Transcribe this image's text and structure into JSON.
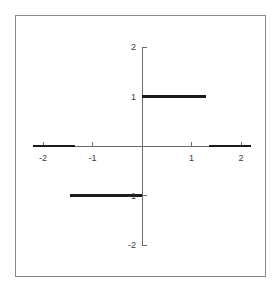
{
  "figure": {
    "frame": {
      "border_color": "#8a8a8a"
    },
    "axis_color": "#6b6b6b",
    "series_color": "#1a1a1a",
    "background": "#ffffff"
  },
  "labels": {
    "x": [
      {
        "value": -2,
        "text": "-2"
      },
      {
        "value": -1,
        "text": "-1"
      },
      {
        "value": 1,
        "text": "1"
      },
      {
        "value": 2,
        "text": "2"
      }
    ],
    "y": [
      {
        "value": 2,
        "text": "2"
      },
      {
        "value": 1,
        "text": "1"
      },
      {
        "value": -1,
        "text": "-1"
      },
      {
        "value": -2,
        "text": "-2"
      }
    ]
  },
  "chart_data": {
    "type": "line",
    "title": "",
    "xlabel": "",
    "ylabel": "",
    "xlim": [
      -2.2,
      2.2
    ],
    "ylim": [
      -2.0,
      2.0
    ],
    "grid": false,
    "legend": null,
    "xticks": [
      -2,
      -1,
      1,
      2
    ],
    "yticks": [
      -2,
      -1,
      1,
      2
    ],
    "xticklabels": [
      "-2",
      "-1",
      "1",
      "2"
    ],
    "yticklabels": [
      "-2",
      "-1",
      "1",
      "2"
    ],
    "series": [
      {
        "name": "segment-left-zero",
        "y": 0,
        "x_start": -2.2,
        "x_end": -1.35,
        "values": [
          [
            -2.2,
            0
          ],
          [
            -1.35,
            0
          ]
        ]
      },
      {
        "name": "segment-lower-minus-one",
        "y": -1,
        "x_start": -1.45,
        "x_end": 0,
        "values": [
          [
            -1.45,
            -1
          ],
          [
            0,
            -1
          ]
        ]
      },
      {
        "name": "segment-upper-one",
        "y": 1,
        "x_start": 0,
        "x_end": 1.3,
        "values": [
          [
            0,
            1
          ],
          [
            1.3,
            1
          ]
        ]
      },
      {
        "name": "segment-right-zero",
        "y": 0,
        "x_start": 1.35,
        "x_end": 2.2,
        "values": [
          [
            1.35,
            0
          ],
          [
            2.2,
            0
          ]
        ]
      }
    ]
  }
}
